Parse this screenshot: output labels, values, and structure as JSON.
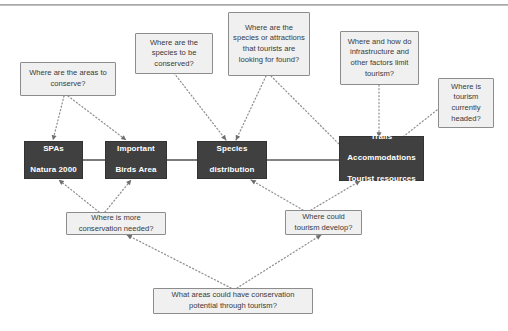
{
  "diagram": {
    "colors": {
      "box_fill": "#404040",
      "box_text": "#ffffff",
      "note_fill": "#f0f0f0",
      "note_border": "#8c8c8c",
      "connector": "#808080",
      "rule": "#a9a9a9"
    },
    "data_boxes": [
      {
        "id": "spas",
        "label": "SPAs\nNatura 2000",
        "line1": "SPAs",
        "line2": "Natura 2000",
        "line3": ""
      },
      {
        "id": "iba",
        "label": "Important\nBirds Area",
        "line1": "Important",
        "line2": "Birds Area",
        "line3": ""
      },
      {
        "id": "species",
        "label": "Species\ndistribution",
        "line1": "Species",
        "line2": "distribution",
        "line3": ""
      },
      {
        "id": "trails",
        "label": "Trails\nAccommodations\nTourist resources",
        "line1": "Trails",
        "line2": "Accommodations",
        "line3": "Tourist resources"
      }
    ],
    "questions": [
      {
        "id": "q-areas-to-conserve",
        "text": "Where are the areas to conserve?"
      },
      {
        "id": "q-species-to-be-conserved",
        "text": "Where are the species to be conserved?"
      },
      {
        "id": "q-species-attractions-tourists",
        "text": "Where are the species or attractions that tourists are looking for found?"
      },
      {
        "id": "q-infrastructure-limits",
        "text": "Where and how do infrastructure and other factors limit tourism?"
      },
      {
        "id": "q-tourism-headed",
        "text": "Where is tourism currently headed?"
      },
      {
        "id": "q-more-conservation-needed",
        "text": "Where is more conservation needed?"
      },
      {
        "id": "q-tourism-develop",
        "text": "Where could tourism develop?"
      },
      {
        "id": "q-conservation-potential-tourism",
        "text": "What areas could have conservation potential through tourism?"
      }
    ]
  }
}
